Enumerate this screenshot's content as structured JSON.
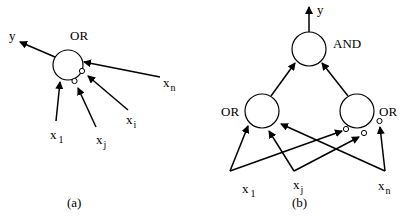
{
  "panel_a": {
    "caption": "(a)",
    "node": {
      "label": "OR"
    },
    "output": {
      "label": "y"
    },
    "inputs": [
      {
        "base": "x",
        "sub": "1",
        "negated": false
      },
      {
        "base": "x",
        "sub": "j",
        "negated": true
      },
      {
        "base": "x",
        "sub": "i",
        "negated": true
      },
      {
        "base": "x",
        "sub": "n",
        "negated": false
      }
    ]
  },
  "panel_b": {
    "caption": "(b)",
    "top_node": {
      "label": "AND"
    },
    "output": {
      "label": "y"
    },
    "left_node": {
      "label": "OR"
    },
    "right_node": {
      "label": "OR"
    },
    "inputs": [
      {
        "base": "x",
        "sub": "1"
      },
      {
        "base": "x",
        "sub": "j"
      },
      {
        "base": "x",
        "sub": "n"
      }
    ]
  }
}
